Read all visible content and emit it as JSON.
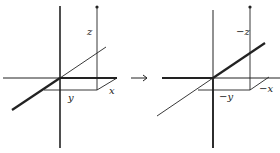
{
  "diagram": {
    "left": {
      "labels": {
        "z": "z",
        "y": "y",
        "x": "x"
      }
    },
    "arrow": "→",
    "right": {
      "labels": {
        "z": "−z",
        "y": "−y",
        "x": "−x"
      }
    },
    "colors": {
      "stroke": "#222222",
      "background": "#ffffff"
    }
  }
}
